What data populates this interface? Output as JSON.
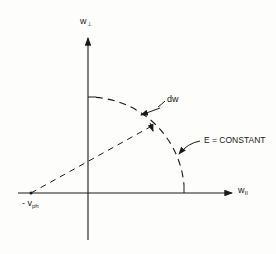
{
  "diagram": {
    "type": "velocity-space schematic",
    "axes": {
      "vertical_label": "w",
      "vertical_subscript": "⊥",
      "horizontal_label": "w",
      "horizontal_subscript": "II"
    },
    "labels": {
      "origin_offset": "- v",
      "origin_offset_subscript": "ph",
      "differential": "dw",
      "curve": "E = CONSTANT"
    },
    "colors": {
      "ink": "#1a1a1a",
      "background": "#fdfdfb"
    }
  }
}
